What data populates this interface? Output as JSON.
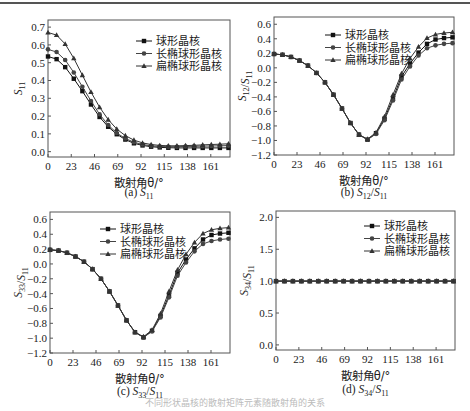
{
  "figure": {
    "legend": [
      "球形晶核",
      "长椭球形晶核",
      "扁椭球形晶核"
    ],
    "xlabel": "散射角θ/°",
    "xticks": [
      0,
      23,
      46,
      69,
      92,
      115,
      138,
      161
    ],
    "xlim": [
      0,
      180
    ],
    "bottom_caption": "不同形状晶核的散射矩阵元素随散射角的关系"
  },
  "chart_data": [
    {
      "id": "a",
      "type": "line",
      "caption_prefix": "(a)",
      "caption_sym": "S",
      "caption_sub": "11",
      "caption_tail": "",
      "ylabel": "S11",
      "ylim": [
        -0.03,
        0.74
      ],
      "yticks": [
        0.0,
        0.1,
        0.2,
        0.3,
        0.4,
        0.5,
        0.6,
        0.7
      ],
      "ytick_format": 1,
      "x": [
        0,
        8.5,
        17,
        25.5,
        34,
        42.5,
        51,
        59.5,
        68,
        76.5,
        85,
        93.5,
        102,
        110.5,
        119,
        127.5,
        136,
        144.5,
        153,
        161.5,
        170,
        178.5
      ],
      "series": [
        {
          "name": "球形晶核",
          "marker": "square",
          "values": [
            0.535,
            0.52,
            0.475,
            0.41,
            0.34,
            0.265,
            0.195,
            0.14,
            0.098,
            0.068,
            0.047,
            0.035,
            0.028,
            0.024,
            0.022,
            0.021,
            0.021,
            0.021,
            0.021,
            0.021,
            0.021,
            0.021
          ]
        },
        {
          "name": "长椭球形晶核",
          "marker": "circle",
          "values": [
            0.575,
            0.56,
            0.515,
            0.445,
            0.365,
            0.285,
            0.21,
            0.15,
            0.105,
            0.074,
            0.053,
            0.04,
            0.033,
            0.029,
            0.028,
            0.028,
            0.029,
            0.03,
            0.031,
            0.032,
            0.033,
            0.034
          ]
        },
        {
          "name": "扁椭球形晶核",
          "marker": "triangle",
          "values": [
            0.67,
            0.655,
            0.605,
            0.525,
            0.43,
            0.335,
            0.25,
            0.18,
            0.127,
            0.09,
            0.065,
            0.049,
            0.04,
            0.035,
            0.033,
            0.033,
            0.034,
            0.036,
            0.038,
            0.04,
            0.042,
            0.044
          ]
        }
      ],
      "legend_pos": "upper-right"
    },
    {
      "id": "b",
      "type": "line",
      "caption_prefix": "(b)",
      "caption_sym": "S",
      "caption_sub": "12",
      "caption_tail": "/S11",
      "ylabel": "S12/S11",
      "ylim": [
        -1.2,
        0.7
      ],
      "yticks": [
        -1.2,
        -1.0,
        -0.8,
        -0.6,
        -0.4,
        -0.2,
        0.0,
        0.2,
        0.4,
        0.6
      ],
      "ytick_format": 1,
      "x": [
        0,
        8.5,
        17,
        25.5,
        34,
        42.5,
        51,
        59.5,
        68,
        76.5,
        85,
        93.5,
        102,
        110.5,
        119,
        127.5,
        136,
        144.5,
        153,
        161.5,
        170,
        178.5
      ],
      "series": [
        {
          "name": "球形晶核",
          "marker": "square",
          "values": [
            0.19,
            0.18,
            0.15,
            0.1,
            0.03,
            -0.07,
            -0.2,
            -0.37,
            -0.56,
            -0.76,
            -0.92,
            -0.99,
            -0.9,
            -0.7,
            -0.42,
            -0.12,
            0.06,
            0.21,
            0.33,
            0.39,
            0.41,
            0.42
          ]
        },
        {
          "name": "长椭球形晶核",
          "marker": "circle",
          "values": [
            0.19,
            0.18,
            0.15,
            0.1,
            0.03,
            -0.07,
            -0.2,
            -0.37,
            -0.56,
            -0.76,
            -0.92,
            -0.99,
            -0.91,
            -0.72,
            -0.45,
            -0.16,
            0.02,
            0.17,
            0.27,
            0.31,
            0.33,
            0.34
          ]
        },
        {
          "name": "扁椭球形晶核",
          "marker": "triangle",
          "values": [
            0.19,
            0.18,
            0.15,
            0.1,
            0.03,
            -0.07,
            -0.2,
            -0.37,
            -0.56,
            -0.76,
            -0.92,
            -0.98,
            -0.89,
            -0.67,
            -0.37,
            -0.08,
            0.13,
            0.29,
            0.41,
            0.46,
            0.48,
            0.49
          ]
        }
      ],
      "legend_pos": "upper-center"
    },
    {
      "id": "c",
      "type": "line",
      "caption_prefix": "(c)",
      "caption_sym": "S",
      "caption_sub": "33",
      "caption_tail": "/S11",
      "ylabel": "S33/S11",
      "ylim": [
        -1.2,
        0.7
      ],
      "yticks": [
        -1.2,
        -1.0,
        -0.8,
        -0.6,
        -0.4,
        -0.2,
        0.0,
        0.2,
        0.4,
        0.6
      ],
      "ytick_format": 1,
      "x": [
        0,
        8.5,
        17,
        25.5,
        34,
        42.5,
        51,
        59.5,
        68,
        76.5,
        85,
        93.5,
        102,
        110.5,
        119,
        127.5,
        136,
        144.5,
        153,
        161.5,
        170,
        178.5
      ],
      "series": [
        {
          "name": "球形晶核",
          "marker": "square",
          "values": [
            0.19,
            0.18,
            0.15,
            0.1,
            0.03,
            -0.07,
            -0.2,
            -0.37,
            -0.56,
            -0.76,
            -0.92,
            -0.99,
            -0.9,
            -0.7,
            -0.42,
            -0.12,
            0.06,
            0.21,
            0.33,
            0.39,
            0.41,
            0.42
          ]
        },
        {
          "name": "长椭球形晶核",
          "marker": "circle",
          "values": [
            0.19,
            0.18,
            0.15,
            0.1,
            0.03,
            -0.07,
            -0.2,
            -0.37,
            -0.56,
            -0.76,
            -0.92,
            -0.99,
            -0.91,
            -0.72,
            -0.45,
            -0.16,
            0.02,
            0.17,
            0.27,
            0.31,
            0.33,
            0.34
          ]
        },
        {
          "name": "扁椭球形晶核",
          "marker": "triangle",
          "values": [
            0.19,
            0.18,
            0.15,
            0.1,
            0.03,
            -0.07,
            -0.2,
            -0.37,
            -0.56,
            -0.76,
            -0.92,
            -0.98,
            -0.89,
            -0.67,
            -0.37,
            -0.08,
            0.13,
            0.29,
            0.41,
            0.46,
            0.48,
            0.49
          ]
        }
      ],
      "legend_pos": "upper-center"
    },
    {
      "id": "d",
      "type": "line",
      "caption_prefix": "(d)",
      "caption_sym": "S",
      "caption_sub": "34",
      "caption_tail": "/S11",
      "ylabel": "S34/S11",
      "ylim": [
        -0.08,
        2.1
      ],
      "yticks": [
        0.0,
        0.5,
        1.0,
        1.5,
        2.0
      ],
      "ytick_format": 1,
      "x": [
        0,
        8.5,
        17,
        25.5,
        34,
        42.5,
        51,
        59.5,
        68,
        76.5,
        85,
        93.5,
        102,
        110.5,
        119,
        127.5,
        136,
        144.5,
        153,
        161.5,
        170,
        178.5
      ],
      "series": [
        {
          "name": "球形晶核",
          "marker": "square",
          "values": [
            1.0,
            1.0,
            1.0,
            1.0,
            1.0,
            1.0,
            1.0,
            1.0,
            1.0,
            1.0,
            1.0,
            1.0,
            1.0,
            1.0,
            1.0,
            1.0,
            1.0,
            1.0,
            1.0,
            1.0,
            1.0,
            1.0
          ]
        },
        {
          "name": "长椭球形晶核",
          "marker": "circle",
          "values": [
            1.0,
            1.0,
            1.0,
            1.0,
            1.0,
            1.0,
            1.0,
            1.0,
            1.0,
            1.0,
            1.0,
            1.0,
            1.0,
            1.0,
            1.0,
            1.0,
            1.0,
            1.0,
            1.0,
            1.0,
            1.0,
            1.0
          ]
        },
        {
          "name": "扁椭球形晶核",
          "marker": "triangle",
          "values": [
            1.0,
            1.0,
            1.0,
            1.0,
            1.0,
            1.0,
            1.0,
            1.0,
            1.0,
            1.0,
            1.0,
            1.0,
            1.0,
            1.0,
            1.0,
            1.0,
            1.0,
            1.0,
            1.0,
            1.0,
            1.0,
            1.0
          ]
        }
      ],
      "legend_pos": "upper-right"
    }
  ]
}
